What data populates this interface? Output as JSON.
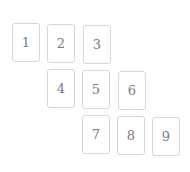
{
  "cards": [
    {
      "label": "1",
      "x": 12,
      "y": 23
    },
    {
      "label": "2",
      "x": 47,
      "y": 24
    },
    {
      "label": "3",
      "x": 83,
      "y": 25
    },
    {
      "label": "4",
      "x": 47,
      "y": 69
    },
    {
      "label": "5",
      "x": 82,
      "y": 70
    },
    {
      "label": "6",
      "x": 118,
      "y": 71
    },
    {
      "label": "7",
      "x": 82,
      "y": 115
    },
    {
      "label": "8",
      "x": 117,
      "y": 116
    },
    {
      "label": "9",
      "x": 152,
      "y": 117
    }
  ],
  "colors": {
    "border": "#d6d6d6",
    "text": "#7a7a7a",
    "background": "#ffffff"
  }
}
